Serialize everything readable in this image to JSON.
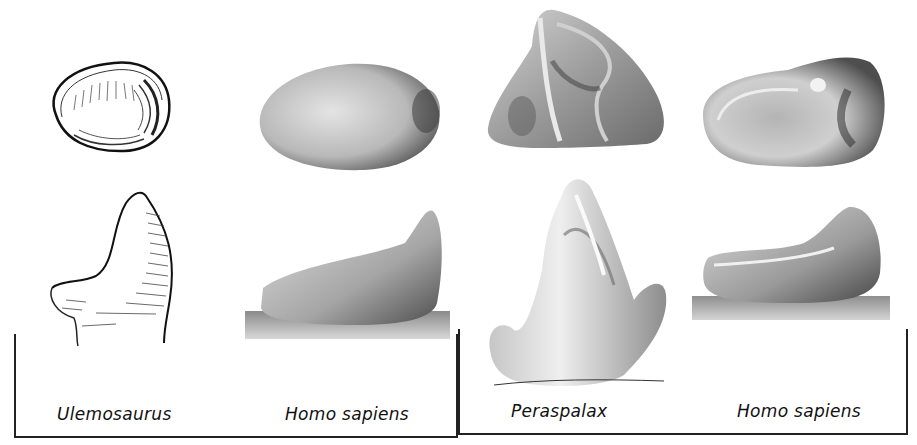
{
  "figure": {
    "groups": [
      {
        "id": "left",
        "pair": [
          {
            "label": "Ulemosaurus",
            "views": [
              "occlusal",
              "lateral"
            ],
            "style": "line drawing"
          },
          {
            "label": "Homo sapiens",
            "views": [
              "occlusal",
              "lateral"
            ],
            "style": "shaded"
          }
        ]
      },
      {
        "id": "right",
        "pair": [
          {
            "label": "Peraspalax",
            "views": [
              "occlusal",
              "lateral"
            ],
            "style": "shaded"
          },
          {
            "label": "Homo sapiens",
            "views": [
              "occlusal",
              "lateral"
            ],
            "style": "shaded"
          }
        ]
      }
    ],
    "captions": {
      "c1": "Ulemosaurus",
      "c2": "Homo sapiens",
      "c3": "Peraspalax",
      "c4": "Homo sapiens"
    },
    "colors": {
      "ink": "#222222",
      "tooth_light": "#e6e6e6",
      "tooth_mid": "#a8a8a8",
      "tooth_dark": "#4a4a4a",
      "background": "#ffffff"
    }
  }
}
